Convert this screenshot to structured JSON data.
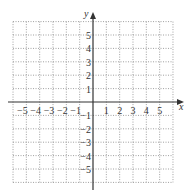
{
  "chart_data": {
    "type": "coordinate-grid",
    "title": "",
    "xlabel": "x",
    "ylabel": "y",
    "xlim": [
      -6,
      6
    ],
    "ylim": [
      -6,
      6
    ],
    "grid": true,
    "grid_style": "dotted",
    "x_tick_labels": [
      "-5",
      "-4",
      "-3",
      "-2",
      "-1",
      "1",
      "2",
      "3",
      "4",
      "5"
    ],
    "x_tick_values": [
      -5,
      -4,
      -3,
      -2,
      -1,
      1,
      2,
      3,
      4,
      5
    ],
    "y_tick_labels": [
      "5",
      "4",
      "3",
      "2",
      "1",
      "-1",
      "-2",
      "-3",
      "-4",
      "-5"
    ],
    "y_tick_values": [
      5,
      4,
      3,
      2,
      1,
      -1,
      -2,
      -3,
      -4,
      -5
    ],
    "series": []
  },
  "axes": {
    "x_label": "x",
    "y_label": "y"
  },
  "colors": {
    "axis": "#333333",
    "grid": "#888888"
  }
}
